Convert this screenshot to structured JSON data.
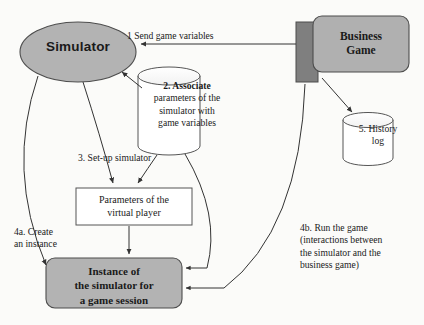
{
  "diagram": {
    "background_color": "#fbfbf9",
    "nodes": {
      "simulator": {
        "label": "Simulator",
        "shape": "ellipse",
        "fill": "#b3b3b3",
        "stroke": "#4d4d4d"
      },
      "business_game": {
        "label": "Business\nGame",
        "line1": "Business",
        "line2": "Game",
        "shape": "rounded-rectangle",
        "fill": "#b0b0b0",
        "stroke": "#4d4d4d",
        "tab_fill": "#7a7a7a"
      },
      "associate_cylinder": {
        "step": "2.",
        "line1": "2. Associate",
        "line2": "parameters of the",
        "line3": "simulator with",
        "line4": "game variables",
        "shape": "cylinder",
        "fill": "#ffffff",
        "stroke": "#555555"
      },
      "history_log": {
        "step": "5.",
        "line1": "5. History",
        "line2": "log",
        "shape": "cylinder",
        "fill": "#ffffff",
        "stroke": "#555555"
      },
      "parameters": {
        "line1": "Parameters of the",
        "line2": "virtual player",
        "shape": "rectangle",
        "fill": "#ffffff",
        "stroke": "#555555"
      },
      "instance": {
        "line1": "Instance of",
        "line2": "the simulator for",
        "line3": "a game session",
        "shape": "rounded-rectangle",
        "fill": "#b3b3b3",
        "stroke": "#4d4d4d"
      }
    },
    "edges": {
      "send_game_variables": {
        "step": "1",
        "text": "1  Send game variables",
        "from": "business_game",
        "to": "simulator"
      },
      "setup_simulator": {
        "step": "3",
        "text": "3. Set-up simulator",
        "from": "simulator",
        "to": "parameters"
      },
      "create_instance": {
        "step": "4a",
        "line1": "4a. Create",
        "line2": "an instance",
        "from": "simulator",
        "to": "instance"
      },
      "run_game": {
        "step": "4b",
        "line1": "4b. Run the game",
        "line2": "(interactions between",
        "line3": "the simulator and the",
        "line4": "business game)",
        "from": "business_game",
        "to": "instance"
      },
      "associate_to_simulator": {
        "from": "associate_cylinder",
        "to": "simulator"
      },
      "associate_to_parameters": {
        "from": "associate_cylinder",
        "to": "parameters"
      },
      "business_game_to_history_log": {
        "from": "business_game",
        "to": "history_log"
      },
      "parameters_to_instance": {
        "from": "parameters",
        "to": "instance"
      },
      "cylinder_to_instance": {
        "from": "associate_cylinder",
        "to": "instance"
      }
    }
  }
}
